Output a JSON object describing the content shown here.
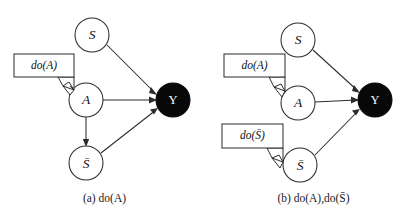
{
  "figure": {
    "background_color": "#ffffff",
    "stroke_color": "#2b2b2b",
    "node_fill": "#ffffff",
    "outcome_fill": "#080808",
    "outcome_text_color": "#ffffff"
  },
  "panels": [
    {
      "id": "panel-a",
      "caption_prefix": "(a)",
      "caption_text": "do(A)",
      "caption_full": "(a) do(A)",
      "nodes": [
        {
          "id": "S",
          "label": "S",
          "style": "open",
          "cx": 92,
          "cy": 35,
          "r": 17
        },
        {
          "id": "A",
          "label": "A",
          "style": "open",
          "cx": 86,
          "cy": 100,
          "r": 17
        },
        {
          "id": "Sb",
          "label": "S̄",
          "style": "open",
          "cx": 86,
          "cy": 163,
          "r": 17
        },
        {
          "id": "Y",
          "label": "Y",
          "style": "filled",
          "cx": 173,
          "cy": 100,
          "r": 17
        }
      ],
      "edges": [
        {
          "from": "S",
          "to": "Y",
          "arrow": true
        },
        {
          "from": "A",
          "to": "Y",
          "arrow": true
        },
        {
          "from": "Sb",
          "to": "Y",
          "arrow": true
        },
        {
          "from": "A",
          "to": "Sb",
          "arrow": true
        }
      ],
      "callouts": [
        {
          "id": "callout-do-a",
          "label": "do(A)",
          "target": "A",
          "x": 14,
          "y": 54,
          "w": 60,
          "h": 23
        }
      ]
    },
    {
      "id": "panel-b",
      "caption_prefix": "(b)",
      "caption_text": "do(A),do(S̄)",
      "caption_full": "(b) do(A),do(S̄)",
      "nodes": [
        {
          "id": "S",
          "label": "S",
          "style": "open",
          "cx": 89,
          "cy": 40,
          "r": 17
        },
        {
          "id": "A",
          "label": "A",
          "style": "open",
          "cx": 89,
          "cy": 103,
          "r": 17
        },
        {
          "id": "Sb",
          "label": "S̄",
          "style": "open",
          "cx": 91,
          "cy": 165,
          "r": 17
        },
        {
          "id": "Y",
          "label": "Y",
          "style": "filled",
          "cx": 166,
          "cy": 100,
          "r": 17
        }
      ],
      "edges": [
        {
          "from": "S",
          "to": "Y",
          "arrow": true
        },
        {
          "from": "A",
          "to": "Y",
          "arrow": true
        },
        {
          "from": "Sb",
          "to": "Y",
          "arrow": true
        }
      ],
      "callouts": [
        {
          "id": "callout-do-a",
          "label": "do(A)",
          "target": "A",
          "x": 15,
          "y": 54,
          "w": 61,
          "h": 23
        },
        {
          "id": "callout-do-sb",
          "label": "do(S̄)",
          "target": "Sb",
          "x": 13,
          "y": 124,
          "w": 61,
          "h": 24
        }
      ]
    }
  ]
}
